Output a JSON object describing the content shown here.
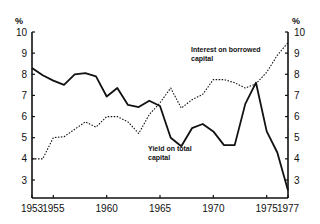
{
  "chart_data": {
    "type": "line",
    "title": "",
    "xlabel": "",
    "ylabel": "%",
    "y2label": "%",
    "x": [
      1953,
      1954,
      1955,
      1956,
      1957,
      1958,
      1959,
      1960,
      1961,
      1962,
      1963,
      1964,
      1965,
      1966,
      1967,
      1968,
      1969,
      1970,
      1971,
      1972,
      1973,
      1974,
      1975,
      1976,
      1977
    ],
    "xticks": [
      1953,
      1955,
      1960,
      1965,
      1970,
      1975,
      1977
    ],
    "yticks": [
      3,
      4,
      5,
      6,
      7,
      8,
      9,
      10
    ],
    "ylim": [
      2.2,
      10
    ],
    "xlim": [
      1953,
      1977
    ],
    "grid": false,
    "legend_position": "inline-annotations",
    "series": [
      {
        "name": "Yield on total capital",
        "style": "solid",
        "color": "#111111",
        "label_lines": [
          "Yield on total",
          "capital"
        ],
        "values": [
          8.3,
          7.95,
          7.7,
          7.5,
          8.0,
          8.05,
          7.9,
          6.95,
          7.35,
          6.55,
          6.45,
          6.75,
          6.5,
          5.0,
          4.6,
          5.45,
          5.65,
          5.3,
          4.65,
          4.65,
          6.6,
          7.6,
          5.3,
          4.3,
          2.5
        ]
      },
      {
        "name": "Interest on borrowed capital",
        "style": "dotted",
        "color": "#111111",
        "label_lines": [
          "Interest on borrowed",
          "capital"
        ],
        "values": [
          4.0,
          4.0,
          5.0,
          5.05,
          5.4,
          5.75,
          5.5,
          6.0,
          6.0,
          5.75,
          5.2,
          6.1,
          6.65,
          7.35,
          6.4,
          6.8,
          7.05,
          7.75,
          7.75,
          7.6,
          7.35,
          7.55,
          8.1,
          8.9,
          9.5
        ]
      }
    ]
  },
  "axes": {
    "left_unit": "%",
    "right_unit": "%"
  }
}
